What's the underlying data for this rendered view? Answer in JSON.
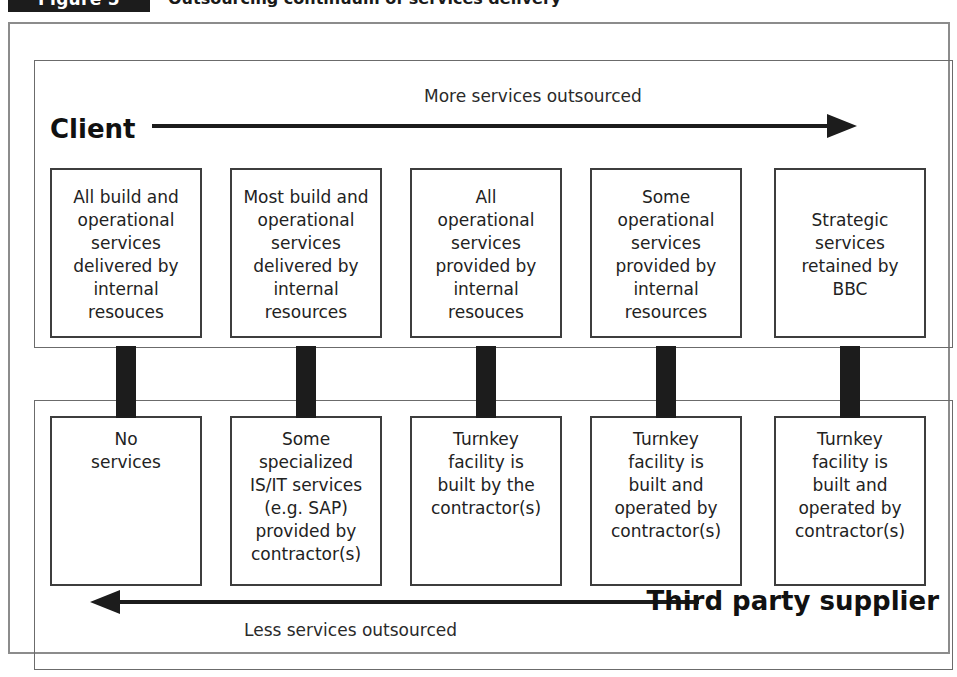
{
  "figure": {
    "badge_label": "Figure 5",
    "caption": "Outsourcing continuum of services delivery"
  },
  "diagram": {
    "top_axis": {
      "side_label": "Client",
      "arrow_caption": "More services outsourced",
      "arrow_direction": "right"
    },
    "bottom_axis": {
      "side_label": "Third party supplier",
      "arrow_caption": "Less services outsourced",
      "arrow_direction": "left"
    },
    "client_boxes": [
      "All build and\noperational\nservices\ndelivered by\ninternal\nresouces",
      "Most build and\noperational\nservices\ndelivered by\ninternal\nresources",
      "All\noperational\nservices\nprovided by\ninternal\nresouces",
      "Some\noperational\nservices\nprovided by\ninternal\nresources",
      "Strategic\nservices\nretained by\nBBC"
    ],
    "supplier_boxes": [
      "No\nservices",
      "Some\nspecialized\nIS/IT services\n(e.g. SAP)\nprovided by\ncontractor(s)",
      "Turnkey\nfacility is\nbuilt by the\ncontractor(s)",
      "Turnkey\nfacility is\nbuilt and\noperated by\ncontractor(s)",
      "Turnkey\nfacility is\nbuilt and\noperated by\ncontractor(s)"
    ],
    "columns": [
      {
        "left": 16,
        "width": 152
      },
      {
        "left": 196,
        "width": 152
      },
      {
        "left": 376,
        "width": 152
      },
      {
        "left": 556,
        "width": 152
      },
      {
        "left": 740,
        "width": 152
      }
    ],
    "colors": {
      "ink": "#1c1c1c",
      "box_border": "#3d3d3d",
      "panel_border": "#6b6b6b",
      "frame_border": "#8c8c8c",
      "background": "#ffffff"
    }
  }
}
